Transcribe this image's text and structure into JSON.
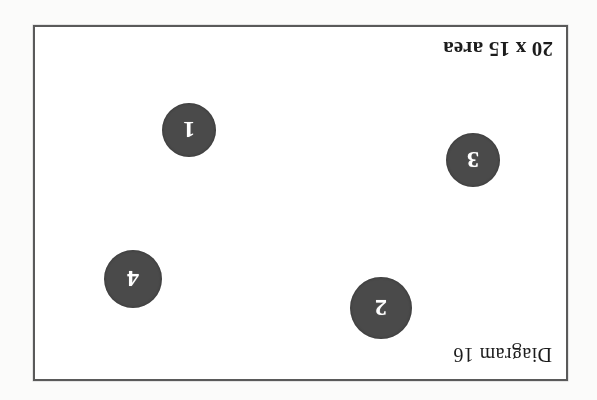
{
  "document": {
    "kind": "scanned-diagram",
    "orientation": "upside-down-180",
    "title_caption": "Diagram 16",
    "area_caption": "20 x 15 area",
    "page_background": "#fbfbfa",
    "frame_background": "#ffffff",
    "frame_border_color": "#5a5a5a",
    "marker_fill": "#4a4a4a",
    "marker_text_color": "#ffffff",
    "caption_text_color": "#1c1c1c"
  },
  "frame": {
    "x": 33,
    "y": 25,
    "width": 535,
    "height": 356
  },
  "markers": [
    {
      "label": "2",
      "cx": 218,
      "cy": 96,
      "diameter": 62
    },
    {
      "label": "4",
      "cx": 466,
      "cy": 125,
      "diameter": 58
    },
    {
      "label": "3",
      "cx": 126,
      "cy": 244,
      "diameter": 54
    },
    {
      "label": "1",
      "cx": 410,
      "cy": 274,
      "diameter": 54
    }
  ]
}
